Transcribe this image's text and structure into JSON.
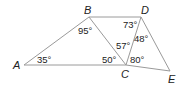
{
  "diagram": {
    "type": "geometry",
    "vertices": [
      {
        "id": "A",
        "label": "A",
        "x": 24,
        "y": 65,
        "lx": 13,
        "ly": 69
      },
      {
        "id": "B",
        "label": "B",
        "x": 89,
        "y": 17,
        "lx": 84,
        "ly": 14
      },
      {
        "id": "C",
        "label": "C",
        "x": 126,
        "y": 65,
        "lx": 121,
        "ly": 78
      },
      {
        "id": "D",
        "label": "D",
        "x": 141,
        "y": 17,
        "lx": 141,
        "ly": 14
      },
      {
        "id": "E",
        "label": "E",
        "x": 170,
        "y": 71,
        "lx": 168,
        "ly": 83
      }
    ],
    "edges": [
      [
        "A",
        "B"
      ],
      [
        "A",
        "C"
      ],
      [
        "B",
        "D"
      ],
      [
        "B",
        "C"
      ],
      [
        "C",
        "D"
      ],
      [
        "D",
        "E"
      ],
      [
        "C",
        "E"
      ]
    ],
    "angles": [
      {
        "label": "35°",
        "vertex": "A",
        "x": 37,
        "y": 63
      },
      {
        "label": "95°",
        "vertex": "B",
        "x": 78,
        "y": 34
      },
      {
        "label": "50°",
        "vertex": "C",
        "x": 102,
        "y": 63
      },
      {
        "label": "57°",
        "vertex": "C",
        "x": 116,
        "y": 49
      },
      {
        "label": "80°",
        "vertex": "C",
        "x": 130,
        "y": 63
      },
      {
        "label": "73°",
        "vertex": "D",
        "x": 123,
        "y": 28
      },
      {
        "label": "48°",
        "vertex": "D",
        "x": 134,
        "y": 42
      }
    ]
  }
}
